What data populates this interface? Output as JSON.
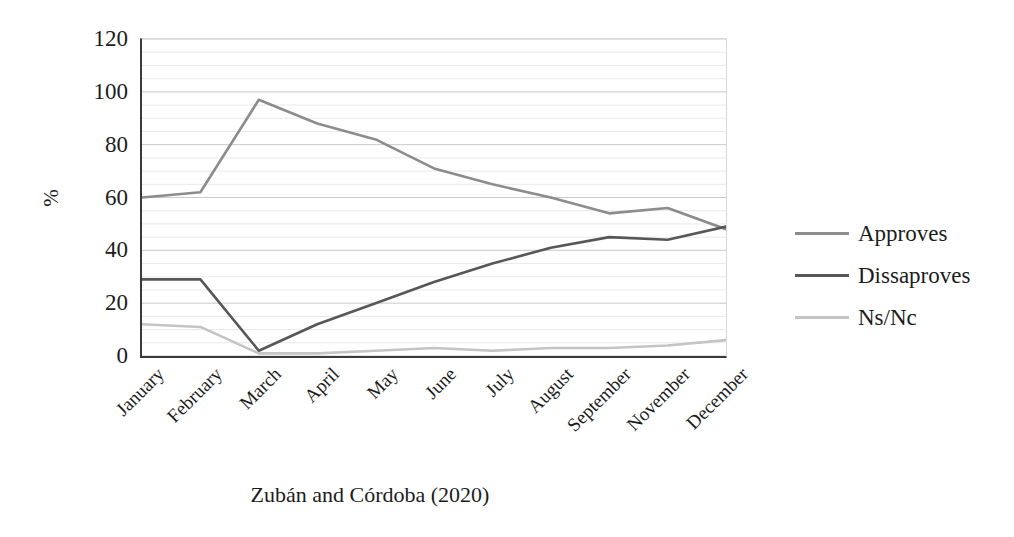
{
  "chart_data": {
    "type": "line",
    "title": "",
    "xlabel": "",
    "ylabel": "%",
    "ylim": [
      0,
      120
    ],
    "yticks": [
      0,
      20,
      40,
      60,
      80,
      100,
      120
    ],
    "grid": true,
    "grid_minor_step": 5,
    "legend_position": "right",
    "categories": [
      "January",
      "February",
      "March",
      "April",
      "May",
      "June",
      "July",
      "August",
      "September",
      "November",
      "December"
    ],
    "series": [
      {
        "name": "Approves",
        "color": "#8c8c8c",
        "values": [
          60,
          62,
          97,
          88,
          82,
          71,
          65,
          60,
          54,
          56,
          48
        ]
      },
      {
        "name": "Dissaproves",
        "color": "#575757",
        "values": [
          29,
          29,
          2,
          12,
          20,
          28,
          35,
          41,
          45,
          44,
          49
        ]
      },
      {
        "name": "Ns/Nc",
        "color": "#c4c4c4",
        "values": [
          12,
          11,
          1,
          1,
          2,
          3,
          2,
          3,
          3,
          4,
          6
        ]
      }
    ],
    "caption": "Zubán and Córdoba (2020)"
  }
}
